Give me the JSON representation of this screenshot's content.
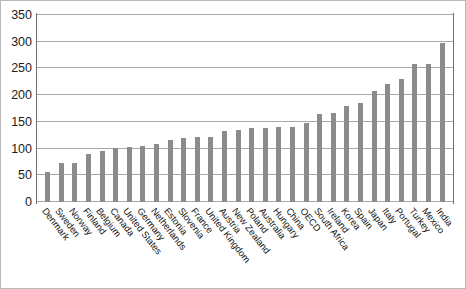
{
  "chart_data": {
    "type": "bar",
    "title": "",
    "xlabel": "",
    "ylabel": "",
    "ylim": [
      0,
      350
    ],
    "yticks": [
      0,
      50,
      100,
      150,
      200,
      250,
      300,
      350
    ],
    "grid": true,
    "legend": false,
    "bar_color": "#8b8b8b",
    "categories": [
      "Denmark",
      "Sweden",
      "Norway",
      "Finland",
      "Belgium",
      "Canada",
      "United States",
      "Germany",
      "Netherlands",
      "Estonia",
      "Slovenia",
      "France",
      "United Kingdom",
      "Austria",
      "New Zealand",
      "Poland",
      "Australia",
      "Hungary",
      "China",
      "OECD",
      "South Africa",
      "Ireland",
      "Korea",
      "Spain",
      "Japan",
      "Italy",
      "Portugal",
      "Turkey",
      "Mexico",
      "India"
    ],
    "values": [
      57,
      73,
      73,
      90,
      95,
      102,
      103,
      105,
      109,
      117,
      120,
      121,
      122,
      132,
      135,
      139,
      139,
      140,
      141,
      148,
      164,
      166,
      180,
      185,
      208,
      220,
      231,
      258,
      258,
      298
    ]
  }
}
